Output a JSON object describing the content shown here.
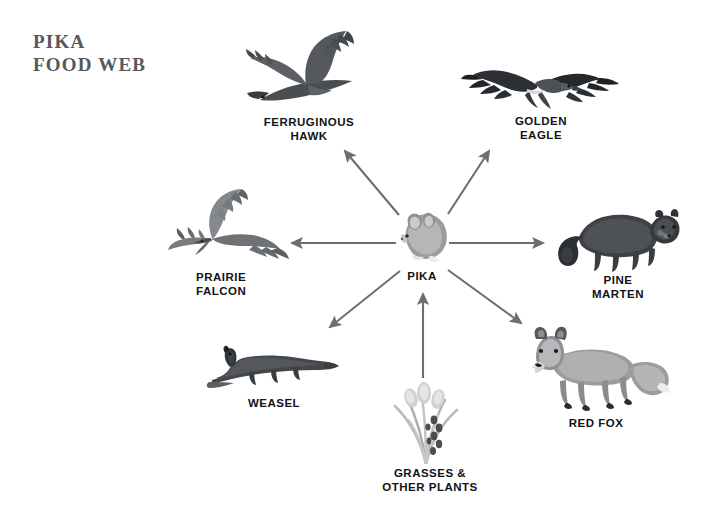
{
  "diagram": {
    "title": "PIKA\nFOOD WEB",
    "type": "food-web",
    "background_color": "#ffffff",
    "title_color": "#55585c",
    "label_color": "#111316",
    "arrow_color": "#6b6e72",
    "center_node": {
      "id": "pika",
      "label": "PIKA",
      "icon": "pika-illustration",
      "x": 422,
      "y": 238
    },
    "nodes": [
      {
        "id": "ferruginous-hawk",
        "label": "FERRUGINOUS\nHAWK",
        "icon": "ferruginous-hawk-illustration",
        "x": 309,
        "y": 75,
        "label_x": 309,
        "label_y": 121,
        "align": "center"
      },
      {
        "id": "golden-eagle",
        "label": "GOLDEN\nEAGLE",
        "icon": "golden-eagle-illustration",
        "x": 541,
        "y": 74,
        "label_x": 541,
        "label_y": 120,
        "align": "center"
      },
      {
        "id": "prairie-falcon",
        "label": "PRAIRIE\nFALCON",
        "icon": "prairie-falcon-illustration",
        "x": 227,
        "y": 235,
        "label_x": 196,
        "label_y": 276,
        "align": "left"
      },
      {
        "id": "pine-marten",
        "label": "PINE\nMARTEN",
        "icon": "pine-marten-illustration",
        "x": 618,
        "y": 238,
        "label_x": 618,
        "label_y": 279,
        "align": "center"
      },
      {
        "id": "weasel",
        "label": "WEASEL",
        "icon": "weasel-illustration",
        "x": 272,
        "y": 369,
        "label_x": 274,
        "label_y": 401,
        "align": "center"
      },
      {
        "id": "red-fox",
        "label": "RED FOX",
        "icon": "red-fox-illustration",
        "x": 591,
        "y": 375,
        "label_x": 596,
        "label_y": 421,
        "align": "center"
      },
      {
        "id": "grasses",
        "label": "GRASSES &\nOTHER PLANTS",
        "icon": "grasses-illustration",
        "x": 423,
        "y": 425,
        "label_x": 430,
        "label_y": 471,
        "align": "center"
      }
    ],
    "edges": [
      {
        "id": "grasses-to-pika",
        "from": "grasses",
        "to": "pika",
        "direction": "up",
        "x1": 423,
        "y1": 378,
        "x2": 423,
        "y2": 292
      },
      {
        "id": "pika-to-hawk",
        "from": "pika",
        "to": "ferruginous-hawk",
        "direction": "up-left",
        "x1": 399,
        "y1": 215,
        "x2": 342,
        "y2": 147
      },
      {
        "id": "pika-to-eagle",
        "from": "pika",
        "to": "golden-eagle",
        "direction": "up-right",
        "x1": 448,
        "y1": 214,
        "x2": 492,
        "y2": 147
      },
      {
        "id": "pika-to-falcon",
        "from": "pika",
        "to": "prairie-falcon",
        "direction": "left",
        "x1": 396,
        "y1": 243,
        "x2": 288,
        "y2": 243
      },
      {
        "id": "pika-to-marten",
        "from": "pika",
        "to": "pine-marten",
        "direction": "right",
        "x1": 449,
        "y1": 243,
        "x2": 547,
        "y2": 243
      },
      {
        "id": "pika-to-weasel",
        "from": "pika",
        "to": "weasel",
        "direction": "down-left",
        "x1": 400,
        "y1": 271,
        "x2": 326,
        "y2": 331
      },
      {
        "id": "pika-to-redfox",
        "from": "pika",
        "to": "red-fox",
        "direction": "down-right",
        "x1": 448,
        "y1": 270,
        "x2": 525,
        "y2": 327
      }
    ]
  }
}
